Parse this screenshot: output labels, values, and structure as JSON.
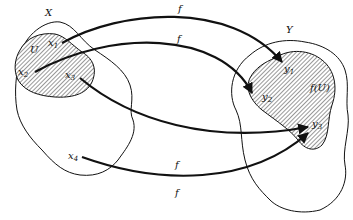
{
  "diagram": {
    "sets": {
      "domain": {
        "label": "X"
      },
      "codomain": {
        "label": "Y"
      },
      "subset": {
        "label": "U"
      },
      "image": {
        "label": "f(U)"
      }
    },
    "points": {
      "x1": {
        "base": "x",
        "sub": "1"
      },
      "x2": {
        "base": "x",
        "sub": "2"
      },
      "x3": {
        "base": "x",
        "sub": "3"
      },
      "x4": {
        "base": "x",
        "sub": "4"
      },
      "y1": {
        "base": "y",
        "sub": "1"
      },
      "y2": {
        "base": "y",
        "sub": "2"
      },
      "y3": {
        "base": "y",
        "sub": "3"
      }
    },
    "arrows": [
      {
        "from": "x1",
        "to": "y1",
        "label": "f"
      },
      {
        "from": "x2",
        "to": "y2",
        "label": "f"
      },
      {
        "from": "x3",
        "to": "y3",
        "label": "f"
      },
      {
        "from": "x4",
        "to": "y3",
        "label": "f"
      }
    ],
    "colors": {
      "ink": "#111111",
      "hatch": "#333333",
      "background": "#ffffff"
    }
  }
}
